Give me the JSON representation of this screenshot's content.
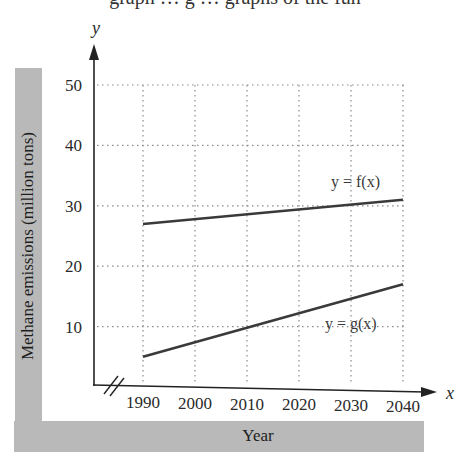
{
  "header_fragment": "graph … g … graphs of the fun",
  "chart_data": {
    "type": "line",
    "title": "",
    "xlabel": "Year",
    "ylabel": "Methane emissions (million tons)",
    "x_axis_symbol": "x",
    "y_axis_symbol": "y",
    "x_ticks": [
      "1990",
      "2000",
      "2010",
      "2020",
      "2030",
      "2040"
    ],
    "y_ticks": [
      "10",
      "20",
      "30",
      "40",
      "50"
    ],
    "xlim": [
      1990,
      2040
    ],
    "ylim": [
      0,
      50
    ],
    "x_axis_break": true,
    "grid": "dotted",
    "series": [
      {
        "name": "y = f(x)",
        "x": [
          1990,
          2040
        ],
        "values": [
          27,
          31
        ]
      },
      {
        "name": "y = g(x)",
        "x": [
          1990,
          2040
        ],
        "values": [
          5,
          17
        ]
      }
    ],
    "annotations": [
      {
        "text": "y = f(x)",
        "near": [
          2035,
          33
        ]
      },
      {
        "text": "y = g(x)",
        "near": [
          2035,
          15
        ]
      }
    ]
  }
}
